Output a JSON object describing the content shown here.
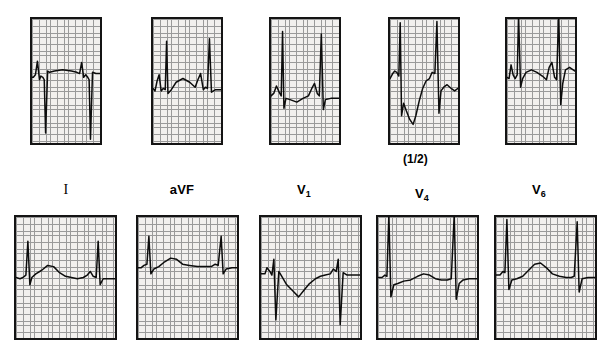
{
  "figure": {
    "type": "ecg-12-lead-strip-figure",
    "background_color": "#ffffff",
    "grid_paper_color": "#f2f0ee",
    "grid_fine_color": "#9a9a9a",
    "grid_major_color": "#3a3a3a",
    "trace_color": "#0c0c0c",
    "annotations": {
      "half_standard": "(1/2)"
    }
  },
  "leads": [
    {
      "id": "lead-I",
      "label": "I",
      "label_style": "roman",
      "subscript": "",
      "half_standard": false
    },
    {
      "id": "lead-aVF",
      "label": "aVF",
      "label_style": "plain",
      "subscript": "",
      "half_standard": false
    },
    {
      "id": "lead-V1",
      "label": "V",
      "label_style": "plain",
      "subscript": "1",
      "half_standard": false
    },
    {
      "id": "lead-V4",
      "label": "V",
      "label_style": "plain",
      "subscript": "4",
      "half_standard": true
    },
    {
      "id": "lead-V6",
      "label": "V",
      "label_style": "plain",
      "subscript": "6",
      "half_standard": false
    }
  ],
  "rows": [
    {
      "id": "top-row",
      "orientation": "portrait",
      "panels": [
        {
          "id": "top-panel-1",
          "lead": "I",
          "x": 30,
          "y": 17,
          "w": 72,
          "h": 128
        },
        {
          "id": "top-panel-2",
          "lead": "aVF",
          "x": 151,
          "y": 17,
          "w": 72,
          "h": 128
        },
        {
          "id": "top-panel-3",
          "lead": "V1",
          "x": 269,
          "y": 17,
          "w": 72,
          "h": 128
        },
        {
          "id": "top-panel-4",
          "lead": "V4",
          "x": 388,
          "y": 17,
          "w": 72,
          "h": 128
        },
        {
          "id": "top-panel-5",
          "lead": "V6",
          "x": 505,
          "y": 17,
          "w": 72,
          "h": 128
        }
      ]
    },
    {
      "id": "bottom-row",
      "orientation": "landscape",
      "panels": [
        {
          "id": "bottom-panel-1",
          "lead": "I",
          "x": 14,
          "y": 215,
          "w": 103,
          "h": 125
        },
        {
          "id": "bottom-panel-2",
          "lead": "aVF",
          "x": 136,
          "y": 215,
          "w": 103,
          "h": 125
        },
        {
          "id": "bottom-panel-3",
          "lead": "V1",
          "x": 259,
          "y": 215,
          "w": 103,
          "h": 125
        },
        {
          "id": "bottom-panel-4",
          "lead": "V4",
          "x": 376,
          "y": 215,
          "w": 103,
          "h": 125
        },
        {
          "id": "bottom-panel-5",
          "lead": "V6",
          "x": 494,
          "y": 215,
          "w": 103,
          "h": 125
        }
      ]
    }
  ],
  "lead_label_positions": [
    {
      "lead": "I",
      "x": 30,
      "y": 182,
      "w": 72
    },
    {
      "lead": "aVF",
      "x": 146,
      "y": 182,
      "w": 72
    },
    {
      "lead": "V1",
      "x": 268,
      "y": 182,
      "w": 72
    },
    {
      "lead": "V4",
      "x": 386,
      "y": 186,
      "w": 72
    },
    {
      "lead": "V6",
      "x": 503,
      "y": 182,
      "w": 72
    }
  ],
  "half_note_position": {
    "x": 403,
    "y": 152
  },
  "chart_data": {
    "type": "line",
    "title": "",
    "xlabel": "",
    "ylabel": "",
    "grid": {
      "fine_divisions_px": 3.6,
      "major_every_n_fine": 5,
      "grid_on": true
    },
    "traces": {
      "top-panel-1": {
        "lead": "I",
        "baseline_frac": 0.47,
        "points": "0,0 0.02,0 0.05,-0.02 0.08,-0.13 0.11,0.02 0.13,-0.01 0.16,0 0.18,0.02 0.20,0.45 0.23,-0.05 0.26,-0.04 0.33,-0.05 0.45,-0.06 0.58,-0.05 0.66,-0.04 0.70,-0.03 0.73,-0.12 0.76,0 0.79,-0.02 0.82,0 0.84,0.02 0.86,0.50 0.89,-0.04 0.94,-0.03 1,-0.03"
      },
      "top-panel-2": {
        "lead": "aVF",
        "baseline_frac": 0.56,
        "points": "0,0 0.03,0.02 0.06,-0.06 0.09,-0.11 0.12,0.02 0.15,0 0.18,0.01 0.20,-0.38 0.22,0.04 0.27,0.01 0.34,-0.05 0.44,-0.08 0.54,-0.05 0.62,-0.01 0.66,-0.07 0.70,-0.12 0.74,0.01 0.77,-0.01 0.80,0 0.83,-0.40 0.86,0.03 0.92,0.01 1,0.01"
      },
      "top-panel-3": {
        "lead": "V1",
        "baseline_frac": 0.62,
        "points": "0,0 0.04,-0.02 0.08,-0.08 0.12,-0.03 0.15,0 0.17,-0.52 0.19,0.10 0.22,0.02 0.28,0.03 0.38,0.05 0.47,0.02 0.55,0 0.60,-0.06 0.64,-0.10 0.68,-0.02 0.71,0 0.74,-0.50 0.77,0.11 0.80,0.03 0.88,0.02 1,0.02"
      },
      "top-panel-4": {
        "lead": "V4",
        "baseline_frac": 0.48,
        "half_standard": true,
        "points": "0,0 0.04,-0.04 0.07,-0.06 0.10,-0.05 0.13,-0.02 0.15,-0.45 0.17,0.30 0.20,0.20 0.24,0.26 0.29,0.33 0.34,0.37 0.38,0.30 0.43,0.18 0.48,0.08 0.53,0.02 0.58,0.00 0.62,-0.05 0.66,-0.04 0.69,-0.46 0.72,0.28 0.75,0.10 0.79,0.07 0.84,0.05 0.90,0.08 0.95,0.10 1,0.08"
      },
      "top-panel-5": {
        "lead": "V6",
        "baseline_frac": 0.47,
        "points": "0,0 0.03,0.01 0.06,-0.10 0.09,-0.02 0.12,0.01 0.15,-0.02 0.17,-0.50 0.20,0.08 0.23,0.01 0.28,-0.04 0.36,-0.06 0.44,-0.04 0.52,-0.01 0.58,0.02 0.62,-0.08 0.66,-0.12 0.70,0 0.73,0.02 0.76,-0.52 0.79,0.22 0.82,0.05 0.86,-0.06 0.92,-0.08 1,-0.05"
      },
      "bottom-panel-1": {
        "lead": "I",
        "baseline_frac": 0.5,
        "points": "0,0 0.04,0.01 0.07,0 0.10,-0.02 0.12,-0.30 0.14,0.06 0.16,0 0.20,-0.03 0.26,-0.06 0.32,-0.10 0.38,-0.09 0.44,-0.04 0.50,-0.01 0.56,0 0.62,0.01 0.68,0 0.72,-0.02 0.75,-0.05 0.78,-0.01 0.81,0 0.83,-0.30 0.85,0.06 0.88,0.01 0.94,0.01 1,0.01"
      },
      "bottom-panel-2": {
        "lead": "aVF",
        "baseline_frac": 0.42,
        "points": "0,0 0.03,0 0.06,-0.02 0.09,-0.03 0.11,-0.26 0.13,0.05 0.16,0.01 0.21,-0.01 0.27,-0.05 0.33,-0.08 0.39,-0.07 0.45,-0.03 0.52,-0.02 0.60,-0.01 0.68,-0.01 0.74,-0.01 0.78,-0.03 0.81,-0.02 0.84,-0.26 0.86,0.05 0.89,0.01 0.95,0 1,0"
      },
      "bottom-panel-3": {
        "lead": "V1",
        "baseline_frac": 0.47,
        "points": "0,0 0.04,0 0.06,-0.05 0.09,-0.02 0.11,0.01 0.13,-0.12 0.15,0.38 0.18,-0.02 0.21,0.02 0.26,0.09 0.32,0.14 0.38,0.19 0.43,0.14 0.49,0.08 0.55,0.04 0.60,0.02 0.65,0.01 0.70,0 0.73,-0.04 0.76,-0.02 0.78,-0.12 0.80,0.42 0.83,-0.01 0.87,0.01 0.93,0.01 1,0.01"
      },
      "bottom-panel-4": {
        "lead": "V4",
        "baseline_frac": 0.5,
        "points": "0,0 0.04,0 0.07,-0.02 0.09,-0.01 0.11,-0.52 0.13,0.16 0.16,0.06 0.20,0.05 0.26,0.03 0.33,0.02 0.40,-0.01 0.46,-0.03 0.52,-0.02 0.58,0.01 0.64,0.02 0.70,0.02 0.74,0.01 0.77,-0.52 0.79,0.18 0.82,0.05 0.86,0.02 0.92,0.01 1,0.01"
      },
      "bottom-panel-5": {
        "lead": "V6",
        "baseline_frac": 0.48,
        "points": "0,0 0.04,0 0.07,-0.03 0.09,-0.02 0.11,-0.46 0.13,0.12 0.16,0.04 0.21,0.03 0.27,0.01 0.33,-0.04 0.39,-0.09 0.45,-0.10 0.51,-0.06 0.57,-0.01 0.64,0.01 0.71,0.02 0.76,0.02 0.79,0.01 0.82,-0.44 0.84,0.14 0.87,0.03 0.93,0.02 1,0.02"
      }
    }
  }
}
